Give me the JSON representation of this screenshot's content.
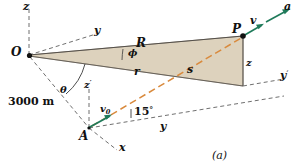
{
  "figure": {
    "caption": "(a)",
    "points": {
      "origin": "O",
      "launch": "A",
      "target": "P"
    },
    "distance_label": "3000 m",
    "angles": {
      "phi": "ϕ",
      "theta": "θ",
      "fifteen": "15",
      "fifteen_unit": "°"
    },
    "lengths": {
      "range_R": "R",
      "radial_r": "r",
      "arc_s": "s",
      "height_z": "z"
    },
    "vectors": {
      "velocity": "v",
      "initial_velocity_base": "v",
      "initial_velocity_sub": "0",
      "acceleration": "a"
    },
    "axes": {
      "z_origin": "z",
      "y_origin": "y",
      "z_launch_base": "z",
      "z_launch_prime": "′",
      "x_launch": "x",
      "y_launch": "y",
      "y_target_base": "y",
      "y_target_prime": "′"
    },
    "colors": {
      "shaded_plane": "#ddd2bd",
      "vector_green": "#1f7a5a",
      "trajectory_orange": "#d98a3d",
      "line_dark": "#2a2a2a",
      "text": "#111111"
    }
  }
}
